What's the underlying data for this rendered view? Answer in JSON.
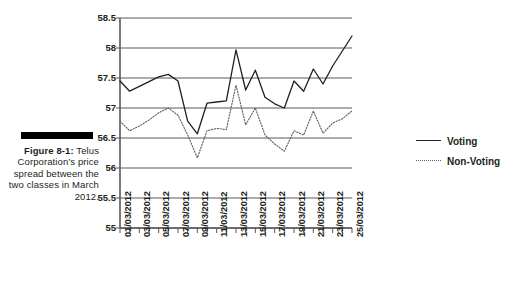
{
  "figure": {
    "label": "Figure 8-1:",
    "caption": "Telus Corporation’s price spread between the two classes in March 2012."
  },
  "legend": {
    "position": "right",
    "items": [
      {
        "label": "Voting",
        "style": "solid",
        "color": "#231f20"
      },
      {
        "label": "Non-Voting",
        "style": "dotted",
        "color": "#5b5b5b"
      }
    ]
  },
  "chart_data": {
    "type": "line",
    "title": "",
    "xlabel": "",
    "ylabel": "",
    "ylim": [
      55,
      58.5
    ],
    "yticks": [
      "55",
      "55.5",
      "56",
      "56.5",
      "57",
      "57.5",
      "58",
      "58.5"
    ],
    "ytick_values": [
      55,
      55.5,
      56,
      56.5,
      57,
      57.5,
      58,
      58.5
    ],
    "grid": true,
    "x": [
      "01/03/2012",
      "02/03/2012",
      "03/03/2012",
      "04/03/2012",
      "05/03/2012",
      "06/03/2012",
      "07/03/2012",
      "08/03/2012",
      "09/03/2012",
      "10/03/2012",
      "11/03/2012",
      "12/03/2012",
      "13/03/2012",
      "14/03/2012",
      "15/03/2012",
      "16/03/2012",
      "17/03/2012",
      "18/03/2012",
      "19/03/2012",
      "20/03/2012",
      "21/03/2012",
      "22/03/2012",
      "23/03/2012",
      "24/03/2012",
      "25/03/2012"
    ],
    "xticklabels": [
      "01/03/2012",
      "",
      "03/03/2012",
      "",
      "05/03/2012",
      "",
      "07/03/2012",
      "",
      "09/03/2012",
      "",
      "11/03/2012",
      "",
      "13/03/2012",
      "",
      "15/03/2012",
      "",
      "17/03/2012",
      "",
      "19/03/2012",
      "",
      "21/03/2012",
      "",
      "23/03/2012",
      "",
      "25/03/2012"
    ],
    "series": [
      {
        "name": "Voting",
        "style": "solid",
        "color": "#231f20",
        "values": [
          57.45,
          57.28,
          57.36,
          57.44,
          57.52,
          57.56,
          57.45,
          56.78,
          56.57,
          57.08,
          57.1,
          57.12,
          57.97,
          57.3,
          57.63,
          57.18,
          57.07,
          57.0,
          57.45,
          57.28,
          57.65,
          57.4,
          57.7,
          57.95,
          58.2
        ]
      },
      {
        "name": "Non-Voting",
        "style": "dotted",
        "color": "#5b5b5b",
        "values": [
          56.78,
          56.62,
          56.7,
          56.8,
          56.92,
          57.0,
          56.88,
          56.55,
          56.17,
          56.62,
          56.66,
          56.64,
          57.38,
          56.72,
          57.0,
          56.55,
          56.4,
          56.28,
          56.62,
          56.55,
          56.95,
          56.58,
          56.75,
          56.82,
          56.95
        ]
      }
    ]
  }
}
